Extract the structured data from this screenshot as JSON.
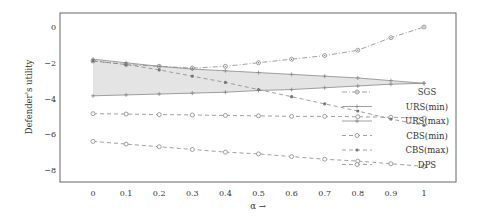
{
  "chart_data": {
    "type": "line",
    "title": "",
    "xlabel": "α →",
    "ylabel": "Defender's utility",
    "xlim": [
      -0.1,
      1.1
    ],
    "ylim": [
      -8.6,
      0.8
    ],
    "x": [
      0,
      0.1,
      0.2,
      0.3,
      0.4,
      0.5,
      0.6,
      0.7,
      0.8,
      0.9,
      1
    ],
    "xticks": [
      "0",
      "0.1",
      "0.2",
      "0.3",
      "0.4",
      "0.5",
      "0.6",
      "0.7",
      "0.8",
      "0.9",
      "1"
    ],
    "yticks": [
      0,
      -2,
      -4,
      -6,
      -8
    ],
    "ytick_labels": [
      "0",
      "−2",
      "−4",
      "−6",
      "−8"
    ],
    "grid": false,
    "legend_position": "bottom-right",
    "series": [
      {
        "name": "SGS",
        "style": "dashdot",
        "marker": "circle-dot",
        "values": [
          -1.9,
          -2.1,
          -2.2,
          -2.3,
          -2.2,
          -2.0,
          -1.8,
          -1.6,
          -1.3,
          -0.6,
          0.0
        ]
      },
      {
        "name": "URS(min)",
        "style": "solid",
        "marker": "plus",
        "values": [
          -1.8,
          -2.0,
          -2.2,
          -2.35,
          -2.45,
          -2.55,
          -2.65,
          -2.75,
          -2.85,
          -3.0,
          -3.15
        ]
      },
      {
        "name": "URS(max)",
        "style": "solid",
        "marker": "plus",
        "values": [
          -3.85,
          -3.8,
          -3.75,
          -3.7,
          -3.65,
          -3.55,
          -3.5,
          -3.4,
          -3.3,
          -3.2,
          -3.15
        ]
      },
      {
        "name": "CBS(min)",
        "style": "dashed",
        "marker": "circle",
        "values": [
          -4.85,
          -4.87,
          -4.9,
          -4.92,
          -4.95,
          -4.97,
          -5.0,
          -5.0,
          -5.02,
          -5.05,
          -5.1
        ]
      },
      {
        "name": "CBS(max)",
        "style": "dashed",
        "marker": "star",
        "values": [
          -1.9,
          -2.1,
          -2.4,
          -2.75,
          -3.1,
          -3.5,
          -3.9,
          -4.3,
          -4.7,
          -5.15,
          -5.5
        ]
      },
      {
        "name": "DPS",
        "style": "dashed",
        "marker": "circle",
        "values": [
          -6.4,
          -6.55,
          -6.7,
          -6.85,
          -7.0,
          -7.1,
          -7.25,
          -7.4,
          -7.5,
          -7.65,
          -7.8
        ]
      }
    ],
    "shaded_band": {
      "between": [
        "URS(min)",
        "URS(max)"
      ],
      "color": "#e6e6e6"
    }
  },
  "colors": {
    "frame": "#666666",
    "line": "#888888",
    "band": "#e4e4e4"
  }
}
